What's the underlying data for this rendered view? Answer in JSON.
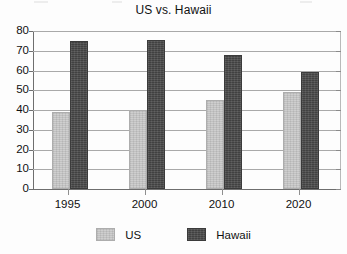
{
  "chart_data": {
    "type": "bar",
    "title": "US vs. Hawaii",
    "xlabel": "",
    "ylabel": "",
    "categories": [
      "1995",
      "2000",
      "2010",
      "2020"
    ],
    "series": [
      {
        "name": "US",
        "values": [
          39,
          40,
          45,
          49
        ],
        "color": "#c9c9c9"
      },
      {
        "name": "Hawaii",
        "values": [
          75,
          75.5,
          68,
          59
        ],
        "color": "#4c4c4c"
      }
    ],
    "ylim": [
      0,
      80
    ],
    "ytick_step": 10,
    "yticks": [
      "80",
      "70",
      "60",
      "50",
      "40",
      "30",
      "20",
      "10",
      "0"
    ],
    "grid": true,
    "legend_position": "bottom"
  },
  "legend": {
    "items": [
      {
        "label": "US"
      },
      {
        "label": "Hawaii"
      }
    ]
  }
}
